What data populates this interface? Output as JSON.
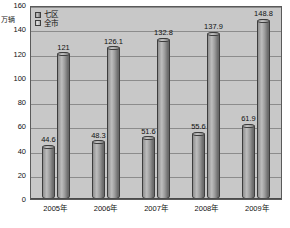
{
  "chart_data": {
    "type": "bar",
    "title": "",
    "xlabel": "",
    "ylabel": "万辆",
    "ylim": [
      0,
      160
    ],
    "ytick_labels": [
      "160",
      "140",
      "120",
      "100",
      "80",
      "60",
      "40",
      "20",
      "0"
    ],
    "yticks": [
      160,
      140,
      120,
      100,
      80,
      60,
      40,
      20,
      0
    ],
    "grid": true,
    "legend_position": "top-left",
    "categories": [
      "2005年",
      "2006年",
      "2007年",
      "2008年",
      "2009年"
    ],
    "series": [
      {
        "name": "七区",
        "values": [
          44.6,
          48.3,
          51.6,
          55.6,
          61.9
        ],
        "labels": [
          "44.6",
          "48.3",
          "51.6",
          "55.6",
          "61.9"
        ]
      },
      {
        "name": "全市",
        "values": [
          121,
          126.1,
          132.8,
          137.9,
          148.8
        ],
        "labels": [
          "121",
          "126.1",
          "132.8",
          "137.9",
          "148.8"
        ]
      }
    ]
  },
  "legend": {
    "items": [
      {
        "label": "七区"
      },
      {
        "label": "全市"
      }
    ]
  },
  "colors": {
    "plot_background": "#c8c8c8",
    "bar_fill": "#9a9a9a",
    "bar_border": "#3d3d3d",
    "gridline": "#8c8c8c",
    "text": "#111111"
  }
}
